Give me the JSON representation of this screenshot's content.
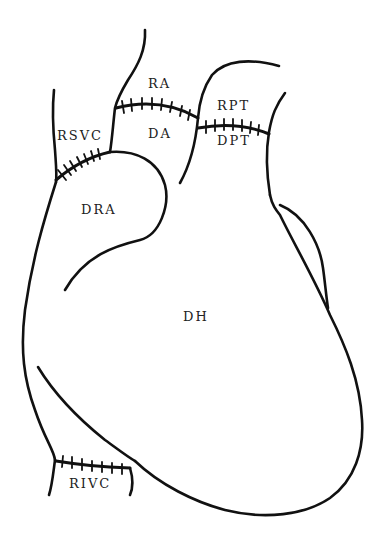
{
  "diagram": {
    "type": "anatomical line drawing",
    "labels": {
      "ra": "RA",
      "da": "DA",
      "rpt": "RPT",
      "dpt": "DPT",
      "rsvc": "RSVC",
      "dra": "DRA",
      "dh": "DH",
      "rivc": "RIVC"
    },
    "colors": {
      "line": "#111111",
      "text": "#222222",
      "background": "#ffffff"
    }
  }
}
